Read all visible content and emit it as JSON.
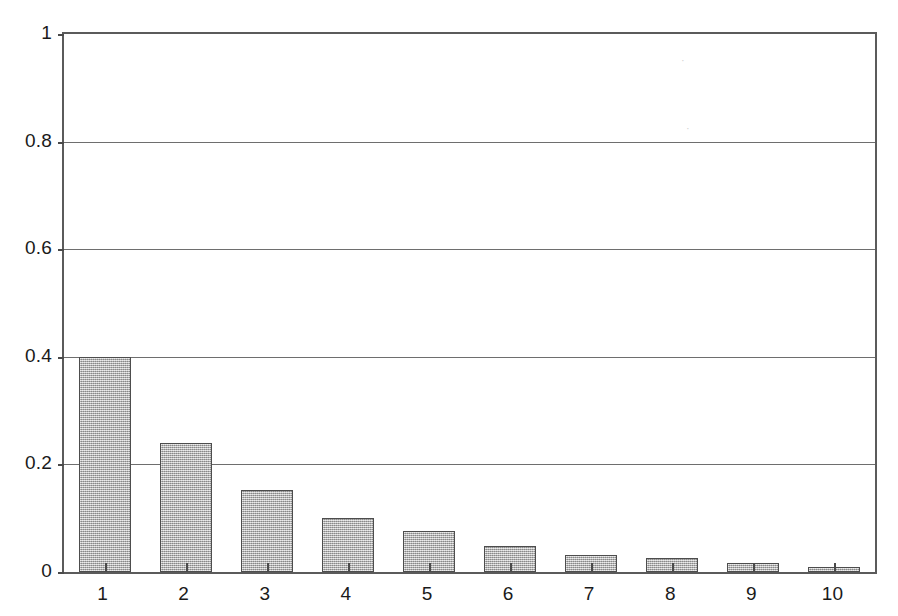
{
  "chart_data": {
    "type": "bar",
    "title": "",
    "subtitle": "",
    "xlabel": "",
    "ylabel": "",
    "categories": [
      "1",
      "2",
      "3",
      "4",
      "5",
      "6",
      "7",
      "8",
      "9",
      "10"
    ],
    "values": [
      0.4,
      0.24,
      0.152,
      0.1,
      0.077,
      0.048,
      0.032,
      0.026,
      0.017,
      0.01
    ],
    "series": [
      {
        "name": "relative frequency",
        "values": [
          0.4,
          0.24,
          0.152,
          0.1,
          0.077,
          0.048,
          0.032,
          0.026,
          0.017,
          0.01
        ]
      }
    ],
    "ylim": [
      0,
      1
    ],
    "xlim": [
      0.5,
      10.5
    ],
    "ytick_labels": [
      "0",
      "0.2",
      "0.4",
      "0.6",
      "0.8",
      "1"
    ],
    "ytick_values": [
      0,
      0.2,
      0.4,
      0.6,
      0.8,
      1
    ],
    "xtick_labels": [
      "1",
      "2",
      "3",
      "4",
      "5",
      "6",
      "7",
      "8",
      "9",
      "10"
    ],
    "grid": "horizontal",
    "legend": "none",
    "annotations": [],
    "bar_fill_color": "#b4b4b4",
    "bar_edge_color": "#4d4d4d",
    "axis_color": "#5b5b5b",
    "gridline_color": "#6e6e6e",
    "background_color": "#ffffff"
  },
  "artifacts": {
    "speck_a": "·",
    "speck_b": "·"
  }
}
